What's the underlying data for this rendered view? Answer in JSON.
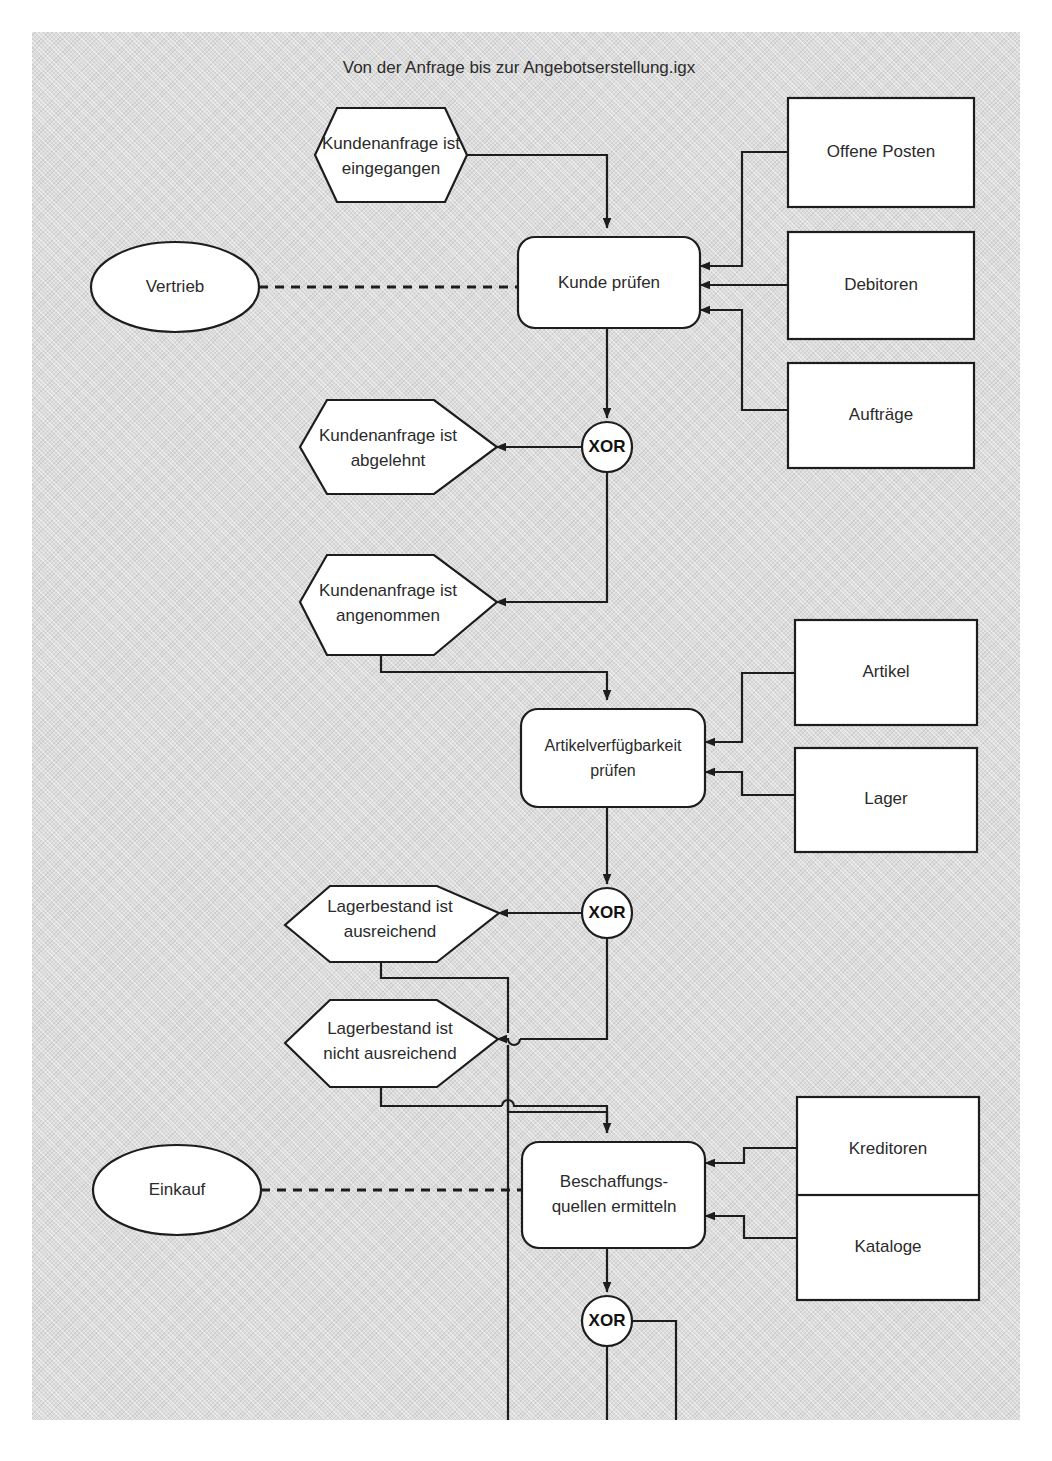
{
  "document": {
    "title": "Von der Anfrage bis zur Angebotserstellung.igx",
    "type": "epc-diagram",
    "language": "de"
  },
  "colors": {
    "page_background": "#dcdcdc",
    "shape_fill": "#ffffff",
    "stroke": "#1d1d1d",
    "text": "#2b2b2b",
    "canvas": "#ffffff"
  },
  "events": {
    "anfrage_eingegangen": {
      "line1": "Kundenanfrage ist",
      "line2": "eingegangen"
    },
    "anfrage_abgelehnt": {
      "line1": "Kundenanfrage ist",
      "line2": "abgelehnt"
    },
    "anfrage_angenommen": {
      "line1": "Kundenanfrage ist",
      "line2": "angenommen"
    },
    "lager_ausreichend": {
      "line1": "Lagerbestand ist",
      "line2": "ausreichend"
    },
    "lager_nicht_ausreichend": {
      "line1": "Lagerbestand ist",
      "line2": "nicht ausreichend"
    }
  },
  "functions": {
    "kunde_pruefen": {
      "line1": "Kunde prüfen",
      "line2": ""
    },
    "artikelverfuegbarkeit_pruefen": {
      "line1": "Artikelverfügbarkeit",
      "line2": "prüfen"
    },
    "beschaffungsquellen_ermitteln": {
      "line1": "Beschaffungs-",
      "line2": "quellen ermitteln"
    }
  },
  "organizational_units": {
    "vertrieb": "Vertrieb",
    "einkauf": "Einkauf"
  },
  "data_objects": {
    "offene_posten": "Offene Posten",
    "debitoren": "Debitoren",
    "auftraege": "Aufträge",
    "artikel": "Artikel",
    "lager": "Lager",
    "kreditoren": "Kreditoren",
    "kataloge": "Kataloge"
  },
  "connectors": {
    "xor_kunde": "XOR",
    "xor_lager": "XOR",
    "xor_beschaffung": "XOR"
  }
}
